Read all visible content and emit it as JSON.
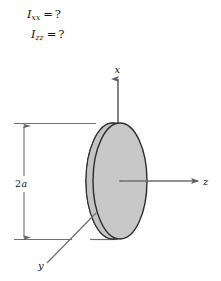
{
  "figure": {
    "background_color": "#ffffff",
    "questions": [
      {
        "symbol": "I",
        "subscript": "xx",
        "relation": "=",
        "value": "?",
        "full_text": "I_xx = ?"
      },
      {
        "symbol": "I",
        "subscript": "zz",
        "relation": "=",
        "value": "?",
        "full_text": "I_zz = ?"
      }
    ],
    "axes": [
      {
        "label": "x",
        "direction": "up",
        "description": "vertical axis through the disk, arrowhead at top"
      },
      {
        "label": "z",
        "direction": "right",
        "description": "axis normal to the disk face, arrowhead at right"
      },
      {
        "label": "y",
        "direction": "down-left",
        "description": "axis drawn in perspective toward lower left"
      }
    ],
    "dimension": {
      "label": "2a",
      "label_number": "2",
      "label_symbol": "a",
      "meaning": "disk diameter",
      "orientation": "vertical",
      "arrow_style": "double-headed between extension lines"
    },
    "body": {
      "shape": "disk",
      "fill_color": "#c8c8c8",
      "edge_color": "#2b2b2b",
      "side_face_visible": true
    },
    "line_color": "#6e6e6e",
    "dark_line_color": "#2b2b2b"
  }
}
